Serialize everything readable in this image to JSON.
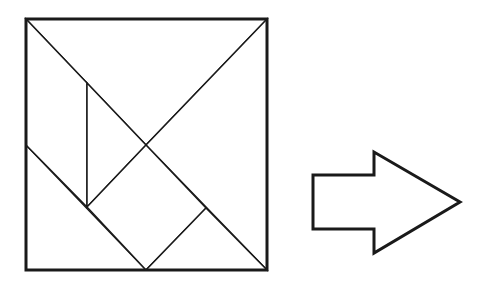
{
  "diagram": {
    "stroke_color": "#1a1a1a",
    "background": "#ffffff",
    "square": {
      "outline": {
        "x": 26,
        "y": 19,
        "width": 241,
        "height": 251
      },
      "pieces": [
        {
          "name": "large-triangle-top",
          "points": "26,19 267,19 146,145"
        },
        {
          "name": "large-triangle-right",
          "points": "267,19 267,270 146,145"
        },
        {
          "name": "medium-triangle-bottom-left",
          "points": "26,145 26,270 146,270"
        },
        {
          "name": "parallelogram-left",
          "points": "26,19 87,83 87,207 26,145"
        },
        {
          "name": "small-triangle-center",
          "points": "87,83 146,145 87,207"
        },
        {
          "name": "square-piece",
          "points": "87,207 146,145 206,208 146,270"
        },
        {
          "name": "small-triangle-bottom-right",
          "points": "206,208 267,270 146,270"
        }
      ]
    },
    "arrow": {
      "name": "right-arrow",
      "points": "313,175 374,175 374,152 460,202 374,253 374,229 313,229"
    }
  }
}
